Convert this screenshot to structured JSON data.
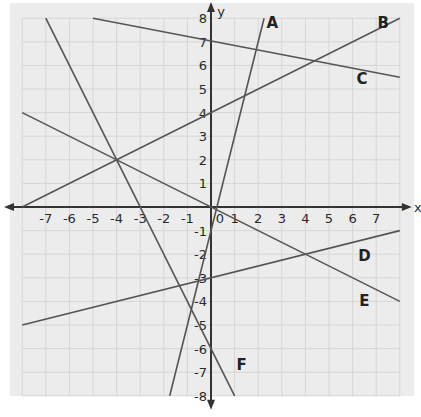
{
  "chart_data": {
    "type": "line",
    "title": "",
    "xlabel": "x",
    "ylabel": "y",
    "xlim": [
      -7.5,
      8
    ],
    "ylim": [
      -8,
      8
    ],
    "grid": true,
    "x_ticks": [
      "-7",
      "-6",
      "-5",
      "-4",
      "-3",
      "-2",
      "-1",
      "0",
      "1",
      "2",
      "3",
      "4",
      "5",
      "6",
      "7"
    ],
    "y_ticks": [
      "8",
      "7",
      "6",
      "5",
      "4",
      "3",
      "2",
      "1",
      "-1",
      "-2",
      "-3",
      "-4",
      "-5",
      "-6",
      "-7",
      "-8"
    ],
    "series": [
      {
        "name": "A",
        "equation": "y = 4x - 1",
        "points": [
          [
            -1.75,
            -8
          ],
          [
            2.25,
            8
          ]
        ],
        "label_pos": [
          2.6,
          7.6
        ]
      },
      {
        "name": "B",
        "equation": "y = 0.5x + 4",
        "points": [
          [
            -8,
            0
          ],
          [
            8,
            8
          ]
        ],
        "label_pos": [
          7.3,
          7.6
        ]
      },
      {
        "name": "C",
        "equation": "y = -0.19x + 7",
        "points": [
          [
            -5,
            8
          ],
          [
            8,
            5.5
          ]
        ],
        "label_pos": [
          6.4,
          5.2
        ]
      },
      {
        "name": "D",
        "equation": "y = 0.25x - 3",
        "points": [
          [
            -8,
            -5
          ],
          [
            8,
            -1
          ]
        ],
        "label_pos": [
          6.5,
          -2.3
        ]
      },
      {
        "name": "E",
        "equation": "y = -0.5x",
        "points": [
          [
            -8,
            4
          ],
          [
            8,
            -4
          ]
        ],
        "label_pos": [
          6.5,
          -4.2
        ]
      },
      {
        "name": "F",
        "equation": "y = -2x - 6",
        "points": [
          [
            -7,
            8
          ],
          [
            1,
            -8
          ]
        ],
        "label_pos": [
          1.3,
          -6.9
        ]
      }
    ],
    "intersections_marked": [
      [
        -4,
        2
      ],
      [
        4,
        -2
      ]
    ],
    "colors": {
      "line": "#555555",
      "grid": "#d6d6d6",
      "background": "#ececec",
      "axis": "#333333"
    }
  }
}
